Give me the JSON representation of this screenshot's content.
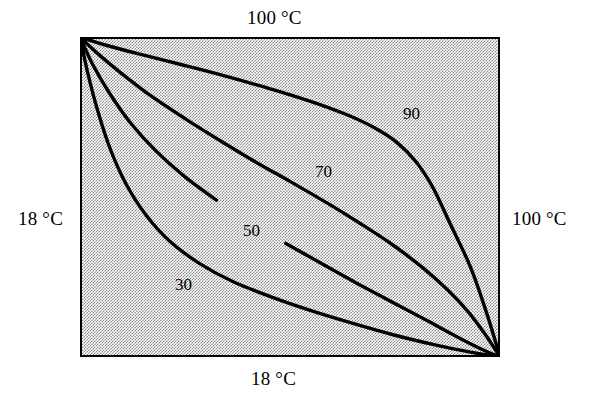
{
  "figure": {
    "kind": "isotherm-contour-diagram",
    "background_color": "#ffffff",
    "box": {
      "fill_pattern": "50-percent-gray-stipple",
      "fill_color": "#8a8a8a",
      "border_color": "#000000",
      "border_width_px": 2,
      "x_px": 80,
      "y_px": 37,
      "width_px": 420,
      "height_px": 320
    },
    "edge_labels": {
      "top": "100 °C",
      "bottom": "18 °C",
      "left": "18 °C",
      "right": "100 °C"
    }
  },
  "chart_data": {
    "type": "line",
    "title": "",
    "xlabel": "",
    "ylabel": "",
    "subtitle": "",
    "grid": false,
    "legend": "none",
    "boundary_conditions": [
      {
        "edge": "top",
        "value": 100,
        "unit": "°C",
        "label": "100 °C"
      },
      {
        "edge": "right",
        "value": 100,
        "unit": "°C",
        "label": "100 °C"
      },
      {
        "edge": "left",
        "value": 18,
        "unit": "°C",
        "label": "18 °C"
      },
      {
        "edge": "bottom",
        "value": 18,
        "unit": "°C",
        "label": "18 °C"
      }
    ],
    "domain": {
      "x": [
        0,
        1
      ],
      "y": [
        0,
        1
      ]
    },
    "contour_levels": [
      30,
      50,
      70,
      90
    ],
    "contour_unit": "°C",
    "series": [
      {
        "name": "90",
        "level": 90,
        "label": "90",
        "label_position_norm": [
          0.77,
          0.25
        ],
        "points_norm": [
          [
            0.0,
            0.0
          ],
          [
            0.06,
            0.025
          ],
          [
            0.14,
            0.053
          ],
          [
            0.24,
            0.086
          ],
          [
            0.34,
            0.12
          ],
          [
            0.44,
            0.157
          ],
          [
            0.54,
            0.197
          ],
          [
            0.63,
            0.24
          ],
          [
            0.7,
            0.283
          ],
          [
            0.755,
            0.33
          ],
          [
            0.8,
            0.39
          ],
          [
            0.84,
            0.47
          ],
          [
            0.88,
            0.58
          ],
          [
            0.93,
            0.72
          ],
          [
            0.97,
            0.87
          ],
          [
            1.0,
            1.0
          ]
        ]
      },
      {
        "name": "70",
        "level": 70,
        "label": "70",
        "label_position_norm": [
          0.565,
          0.41
        ],
        "points_norm": [
          [
            0.0,
            0.0
          ],
          [
            0.045,
            0.055
          ],
          [
            0.1,
            0.115
          ],
          [
            0.17,
            0.185
          ],
          [
            0.25,
            0.255
          ],
          [
            0.335,
            0.325
          ],
          [
            0.42,
            0.392
          ],
          [
            0.505,
            0.455
          ],
          [
            0.59,
            0.52
          ],
          [
            0.67,
            0.585
          ],
          [
            0.745,
            0.65
          ],
          [
            0.815,
            0.72
          ],
          [
            0.875,
            0.79
          ],
          [
            0.925,
            0.86
          ],
          [
            0.965,
            0.93
          ],
          [
            1.0,
            1.0
          ]
        ]
      },
      {
        "name": "50",
        "level": 50,
        "label": "50",
        "label_position_norm": [
          0.395,
          0.585
        ],
        "points_norm": [
          [
            0.0,
            0.0
          ],
          [
            0.03,
            0.085
          ],
          [
            0.07,
            0.175
          ],
          [
            0.12,
            0.268
          ],
          [
            0.18,
            0.355
          ],
          [
            0.25,
            0.437
          ],
          [
            0.325,
            0.51
          ],
          [
            0.405,
            0.578
          ],
          [
            0.49,
            0.645
          ],
          [
            0.575,
            0.708
          ],
          [
            0.66,
            0.77
          ],
          [
            0.745,
            0.83
          ],
          [
            0.825,
            0.885
          ],
          [
            0.895,
            0.935
          ],
          [
            0.955,
            0.975
          ],
          [
            1.0,
            1.0
          ]
        ]
      },
      {
        "name": "30",
        "level": 30,
        "label": "30",
        "label_position_norm": [
          0.225,
          0.76
        ],
        "points_norm": [
          [
            0.0,
            0.0
          ],
          [
            0.018,
            0.11
          ],
          [
            0.042,
            0.23
          ],
          [
            0.072,
            0.35
          ],
          [
            0.11,
            0.46
          ],
          [
            0.158,
            0.558
          ],
          [
            0.215,
            0.64
          ],
          [
            0.285,
            0.708
          ],
          [
            0.365,
            0.765
          ],
          [
            0.455,
            0.812
          ],
          [
            0.55,
            0.855
          ],
          [
            0.65,
            0.895
          ],
          [
            0.75,
            0.932
          ],
          [
            0.845,
            0.962
          ],
          [
            0.93,
            0.985
          ],
          [
            1.0,
            1.0
          ]
        ]
      }
    ]
  }
}
